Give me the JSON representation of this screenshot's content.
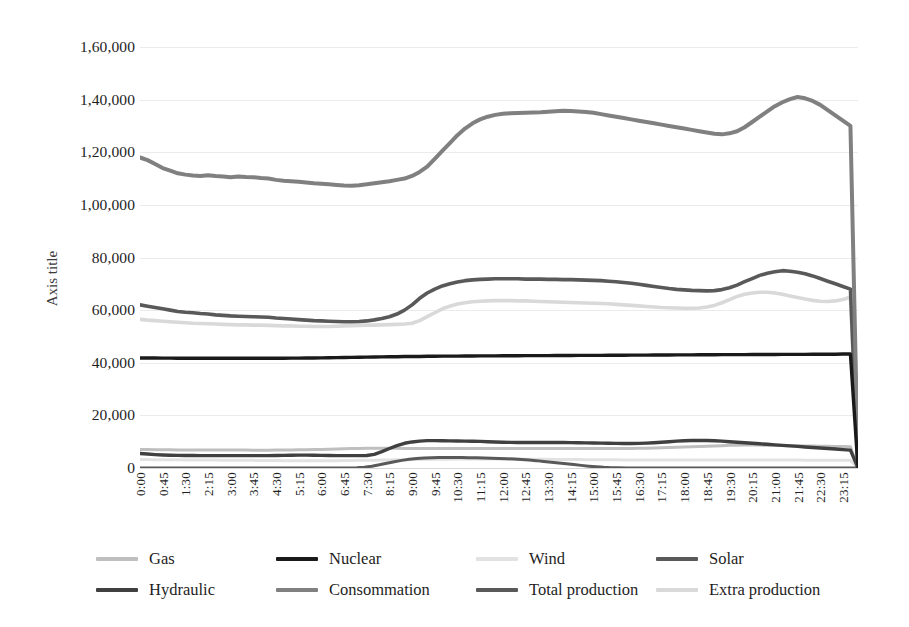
{
  "chart_data": {
    "type": "line",
    "title": "",
    "xlabel": "",
    "ylabel": "Axis title",
    "ylim": [
      0,
      160000
    ],
    "ytick_step": 20000,
    "grid": true,
    "legend_position": "bottom",
    "number_format": "indian-grouping",
    "y_tick_labels": [
      "1,60,000",
      "1,40,000",
      "1,20,000",
      "1,00,000",
      "80,000",
      "60,000",
      "40,000",
      "20,000",
      "0"
    ],
    "y_tick_values": [
      160000,
      140000,
      120000,
      100000,
      80000,
      60000,
      40000,
      20000,
      0
    ],
    "x_tick_labels": [
      "0:00",
      "0:45",
      "1:30",
      "2:15",
      "3:00",
      "3:45",
      "4:30",
      "5:15",
      "6:00",
      "6:45",
      "7:30",
      "8:15",
      "9:00",
      "9:45",
      "10:30",
      "11:15",
      "12:00",
      "12:45",
      "13:30",
      "14:15",
      "15:00",
      "15:45",
      "16:30",
      "17:15",
      "18:00",
      "18:45",
      "19:30",
      "20:15",
      "21:00",
      "21:45",
      "22:30",
      "23:15"
    ],
    "x_interval_minutes": 45,
    "x_point_count": 96,
    "series": [
      {
        "name": "Gas",
        "color": "#bfbfbf",
        "width": 3,
        "values": [
          7000,
          7000,
          6950,
          6900,
          6900,
          6850,
          6850,
          6800,
          6800,
          6800,
          6800,
          6800,
          6800,
          6800,
          6800,
          6750,
          6750,
          6750,
          6800,
          6800,
          6850,
          6900,
          6950,
          7000,
          7050,
          7100,
          7200,
          7300,
          7400,
          7450,
          7500,
          7500,
          7500,
          7500,
          7500,
          7450,
          7450,
          7400,
          7400,
          7400,
          7400,
          7400,
          7400,
          7400,
          7400,
          7400,
          7400,
          7400,
          7400,
          7400,
          7400,
          7400,
          7400,
          7400,
          7400,
          7400,
          7400,
          7400,
          7400,
          7400,
          7400,
          7400,
          7400,
          7400,
          7400,
          7450,
          7500,
          7550,
          7600,
          7700,
          7800,
          7900,
          8000,
          8100,
          8200,
          8300,
          8400,
          8500,
          8600,
          8650,
          8700,
          8700,
          8700,
          8650,
          8600,
          8550,
          8500,
          8450,
          8400,
          8350,
          8300,
          8250,
          8200,
          8150,
          8100,
          0
        ]
      },
      {
        "name": "Nuclear",
        "color": "#1a1a1a",
        "width": 3.4,
        "values": [
          41800,
          41800,
          41800,
          41750,
          41750,
          41700,
          41700,
          41700,
          41700,
          41700,
          41700,
          41700,
          41700,
          41700,
          41700,
          41700,
          41700,
          41700,
          41700,
          41700,
          41750,
          41750,
          41800,
          41800,
          41850,
          41900,
          41950,
          42000,
          42050,
          42100,
          42150,
          42200,
          42250,
          42300,
          42300,
          42350,
          42400,
          42400,
          42450,
          42450,
          42500,
          42500,
          42500,
          42550,
          42550,
          42600,
          42600,
          42600,
          42650,
          42650,
          42650,
          42700,
          42700,
          42700,
          42700,
          42750,
          42750,
          42750,
          42800,
          42800,
          42800,
          42800,
          42850,
          42850,
          42850,
          42900,
          42900,
          42900,
          42950,
          42950,
          42950,
          43000,
          43000,
          43000,
          43050,
          43050,
          43050,
          43100,
          43100,
          43100,
          43100,
          43150,
          43150,
          43150,
          43150,
          43200,
          43200,
          43200,
          43200,
          43250,
          43250,
          43250,
          43250,
          43300,
          43300,
          0
        ]
      },
      {
        "name": "Wind",
        "color": "#e2e2e2",
        "width": 3,
        "values": [
          3200,
          3200,
          3150,
          3150,
          3100,
          3100,
          3050,
          3050,
          3000,
          3000,
          3000,
          2950,
          2950,
          2900,
          2900,
          2900,
          2850,
          2850,
          2850,
          2800,
          2800,
          2800,
          2800,
          2800,
          2800,
          2800,
          2800,
          2850,
          2850,
          2900,
          2900,
          2950,
          3000,
          3050,
          3100,
          3150,
          3200,
          3250,
          3300,
          3300,
          3350,
          3350,
          3400,
          3400,
          3400,
          3400,
          3400,
          3400,
          3400,
          3400,
          3400,
          3350,
          3350,
          3300,
          3300,
          3250,
          3250,
          3200,
          3200,
          3150,
          3150,
          3100,
          3100,
          3100,
          3050,
          3050,
          3050,
          3000,
          3000,
          3000,
          3000,
          3000,
          3000,
          3000,
          3000,
          3000,
          3000,
          3000,
          3000,
          3000,
          3000,
          3000,
          3000,
          3000,
          3000,
          3000,
          3000,
          3000,
          2950,
          2950,
          2950,
          2950,
          2950,
          2900,
          2900,
          0
        ]
      },
      {
        "name": "Solar",
        "color": "#595959",
        "width": 3,
        "values": [
          0,
          0,
          0,
          0,
          0,
          0,
          0,
          0,
          0,
          0,
          0,
          0,
          0,
          0,
          0,
          0,
          0,
          0,
          0,
          0,
          0,
          0,
          0,
          0,
          0,
          0,
          0,
          0,
          0,
          100,
          300,
          700,
          1200,
          1800,
          2400,
          2900,
          3300,
          3600,
          3800,
          3900,
          4000,
          4000,
          4000,
          3950,
          3900,
          3850,
          3800,
          3700,
          3600,
          3500,
          3400,
          3200,
          3000,
          2800,
          2500,
          2200,
          1900,
          1600,
          1300,
          1000,
          700,
          450,
          250,
          120,
          50,
          10,
          0,
          0,
          0,
          0,
          0,
          0,
          0,
          0,
          0,
          0,
          0,
          0,
          0,
          0,
          0,
          0,
          0,
          0,
          0,
          0,
          0,
          0,
          0,
          0,
          0,
          0,
          0,
          0,
          0,
          0,
          0
        ]
      },
      {
        "name": "Hydraulic",
        "color": "#404040",
        "width": 3.4,
        "values": [
          5500,
          5300,
          5100,
          4950,
          4850,
          4800,
          4750,
          4750,
          4700,
          4700,
          4700,
          4700,
          4700,
          4700,
          4700,
          4700,
          4700,
          4700,
          4750,
          4800,
          4850,
          4900,
          4900,
          4850,
          4800,
          4750,
          4700,
          4700,
          4700,
          4700,
          4750,
          5200,
          6200,
          7400,
          8500,
          9400,
          9900,
          10200,
          10400,
          10400,
          10350,
          10300,
          10250,
          10200,
          10150,
          10100,
          10000,
          9900,
          9800,
          9750,
          9700,
          9700,
          9700,
          9700,
          9700,
          9700,
          9700,
          9650,
          9600,
          9550,
          9500,
          9450,
          9400,
          9350,
          9300,
          9300,
          9350,
          9450,
          9600,
          9800,
          10000,
          10200,
          10350,
          10450,
          10500,
          10450,
          10350,
          10200,
          10000,
          9800,
          9600,
          9400,
          9200,
          9000,
          8800,
          8600,
          8400,
          8200,
          8000,
          7800,
          7600,
          7400,
          7200,
          7000,
          6800,
          0
        ]
      },
      {
        "name": "Consommation",
        "color": "#808080",
        "width": 4,
        "values": [
          118000,
          117000,
          115500,
          114000,
          113000,
          112000,
          111500,
          111200,
          111000,
          111300,
          111000,
          110800,
          110500,
          110800,
          110600,
          110500,
          110200,
          110000,
          109500,
          109200,
          109000,
          108800,
          108500,
          108200,
          108000,
          107800,
          107600,
          107400,
          107300,
          107500,
          107800,
          108200,
          108600,
          109000,
          109500,
          110000,
          111000,
          112500,
          114500,
          117500,
          120500,
          123500,
          126500,
          129000,
          131000,
          132500,
          133500,
          134200,
          134600,
          134800,
          134900,
          135000,
          135100,
          135200,
          135400,
          135600,
          135800,
          135700,
          135500,
          135300,
          135000,
          134500,
          134000,
          133500,
          133000,
          132500,
          132000,
          131500,
          131000,
          130500,
          130000,
          129500,
          129000,
          128500,
          128000,
          127500,
          127000,
          126800,
          127200,
          128000,
          129500,
          131500,
          133500,
          135500,
          137500,
          139000,
          140200,
          141000,
          140500,
          139500,
          138000,
          136000,
          134000,
          132000,
          130000,
          0
        ]
      },
      {
        "name": "Total production",
        "color": "#595959",
        "width": 3.6,
        "values": [
          62000,
          61500,
          61000,
          60500,
          60000,
          59500,
          59200,
          59000,
          58700,
          58500,
          58200,
          58000,
          57800,
          57700,
          57600,
          57500,
          57400,
          57300,
          57000,
          56800,
          56600,
          56400,
          56200,
          56000,
          55900,
          55800,
          55700,
          55600,
          55600,
          55700,
          55900,
          56300,
          56800,
          57500,
          58500,
          60000,
          62000,
          64500,
          66500,
          68000,
          69200,
          70000,
          70700,
          71200,
          71500,
          71700,
          71800,
          71900,
          71900,
          71900,
          71900,
          71800,
          71800,
          71800,
          71700,
          71700,
          71600,
          71600,
          71500,
          71400,
          71300,
          71200,
          71000,
          70800,
          70500,
          70200,
          69800,
          69400,
          69000,
          68600,
          68200,
          67900,
          67700,
          67500,
          67400,
          67300,
          67400,
          67800,
          68500,
          69500,
          70800,
          72000,
          73200,
          74000,
          74600,
          75000,
          74800,
          74400,
          73800,
          73000,
          72000,
          71000,
          70000,
          69000,
          68000,
          0
        ]
      },
      {
        "name": "Extra production",
        "color": "#d9d9d9",
        "width": 3.6,
        "values": [
          56500,
          56200,
          56000,
          55800,
          55600,
          55400,
          55200,
          55000,
          54900,
          54800,
          54700,
          54600,
          54500,
          54400,
          54400,
          54300,
          54300,
          54200,
          54100,
          54000,
          54000,
          53900,
          53900,
          53800,
          53800,
          53800,
          53900,
          54000,
          54100,
          54200,
          54300,
          54300,
          54400,
          54500,
          54600,
          54700,
          55000,
          56000,
          57500,
          59000,
          60500,
          61500,
          62300,
          62800,
          63200,
          63400,
          63500,
          63600,
          63600,
          63600,
          63500,
          63500,
          63400,
          63300,
          63200,
          63100,
          63000,
          62900,
          62800,
          62700,
          62600,
          62500,
          62400,
          62200,
          62000,
          61800,
          61600,
          61400,
          61200,
          61000,
          60900,
          60800,
          60700,
          60700,
          60800,
          61200,
          61800,
          62800,
          64000,
          65200,
          66000,
          66500,
          66800,
          66800,
          66500,
          66000,
          65400,
          64800,
          64200,
          63700,
          63400,
          63300,
          63500,
          64000,
          65000,
          0
        ]
      }
    ]
  },
  "legend": {
    "rows": [
      [
        {
          "label": "Gas",
          "color": "#bfbfbf"
        },
        {
          "label": "Nuclear",
          "color": "#1a1a1a"
        },
        {
          "label": "Wind",
          "color": "#e2e2e2"
        },
        {
          "label": "Solar",
          "color": "#595959"
        }
      ],
      [
        {
          "label": "Hydraulic",
          "color": "#404040"
        },
        {
          "label": "Consommation",
          "color": "#808080"
        },
        {
          "label": "Total production",
          "color": "#595959"
        },
        {
          "label": "Extra production",
          "color": "#d9d9d9"
        }
      ]
    ]
  }
}
